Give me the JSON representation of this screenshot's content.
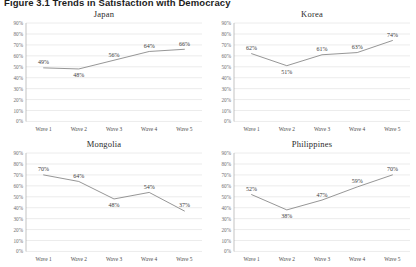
{
  "figure": {
    "title": "Figure 3.1 Trends in Satisfaction with Democracy"
  },
  "axis": {
    "y_ticks": [
      "90%",
      "80%",
      "70%",
      "60%",
      "50%",
      "40%",
      "30%",
      "20%",
      "10%",
      "0%"
    ],
    "x_ticks": [
      "Wave 1",
      "Wave 2",
      "Wave 3",
      "Wave 4",
      "Wave 5"
    ]
  },
  "panels": [
    {
      "title": "Japan",
      "labels": [
        "49%",
        "48%",
        "56%",
        "64%",
        "66%"
      ]
    },
    {
      "title": "Korea",
      "labels": [
        "62%",
        "51%",
        "61%",
        "63%",
        "74%"
      ]
    },
    {
      "title": "Mongolia",
      "labels": [
        "70%",
        "64%",
        "48%",
        "54%",
        "37%"
      ]
    },
    {
      "title": "Philippines",
      "labels": [
        "52%",
        "38%",
        "47%",
        "59%",
        "70%"
      ]
    }
  ],
  "colors": {
    "line": "#8a8a8a",
    "grid": "#d9d9d9",
    "axis": "#9a9a9a",
    "text": "#3a3a3a"
  },
  "chart_data": {
    "type": "line",
    "title": "Figure 3.1 Trends in Satisfaction with Democracy",
    "xlabel": "",
    "ylabel": "",
    "ylim": [
      0,
      90
    ],
    "ytick_step": 10,
    "grid": true,
    "legend": "none",
    "layout": "2x2 small multiples",
    "x": [
      "Wave 1",
      "Wave 2",
      "Wave 3",
      "Wave 4",
      "Wave 5"
    ],
    "panels": [
      {
        "title": "Japan",
        "values": [
          49,
          48,
          56,
          64,
          66
        ]
      },
      {
        "title": "Korea",
        "values": [
          62,
          51,
          61,
          63,
          74
        ]
      },
      {
        "title": "Mongolia",
        "values": [
          70,
          64,
          48,
          54,
          37
        ]
      },
      {
        "title": "Philippines",
        "values": [
          52,
          38,
          47,
          59,
          70
        ]
      }
    ],
    "series": [
      {
        "name": "Japan",
        "values": [
          49,
          48,
          56,
          64,
          66
        ]
      },
      {
        "name": "Korea",
        "values": [
          62,
          51,
          61,
          63,
          74
        ]
      },
      {
        "name": "Mongolia",
        "values": [
          70,
          64,
          48,
          54,
          37
        ]
      },
      {
        "name": "Philippines",
        "values": [
          52,
          38,
          47,
          59,
          70
        ]
      }
    ],
    "data_labels": true,
    "value_unit": "percent"
  }
}
